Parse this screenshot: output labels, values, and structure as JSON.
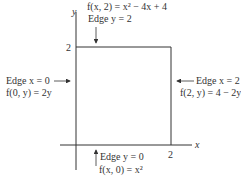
{
  "diagram": {
    "axes": {
      "x_label": "x",
      "y_label": "y",
      "x_tick": "2",
      "y_tick": "2"
    },
    "edges": {
      "top": {
        "edge_label": "Edge y = 2",
        "function": "f(x, 2) = x² − 4x + 4"
      },
      "bottom": {
        "edge_label": "Edge y = 0",
        "function": "f(x, 0) = x²"
      },
      "left": {
        "edge_label": "Edge x = 0",
        "function": "f(0, y) = 2y"
      },
      "right": {
        "edge_label": "Edge x = 2",
        "function": "f(2, y) = 4 − 2y"
      }
    },
    "colors": {
      "line": "#333333",
      "background": "#ffffff"
    }
  }
}
